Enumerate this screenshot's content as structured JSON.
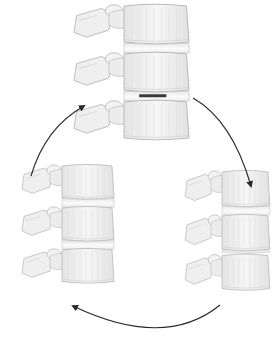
{
  "figure": {
    "title": "",
    "background": "#ffffff",
    "colors": {
      "bone_fill": "#f1f1f1",
      "bone_shade": "#d9d9d9",
      "bone_outline": "#b5b5b5",
      "disc_fill": "#fafafa",
      "disc_lesion": "#3a3a3a",
      "arrow": "#2a2a2a"
    },
    "stages": [
      {
        "id": "stage-top",
        "position": "top",
        "label": "",
        "disc_lesion": true
      },
      {
        "id": "stage-bottom-right",
        "position": "bottom-right",
        "label": "",
        "disc_lesion": false
      },
      {
        "id": "stage-bottom-left",
        "position": "bottom-left",
        "label": "",
        "disc_lesion": false
      }
    ],
    "arrows": [
      {
        "id": "arrow-top-to-right",
        "from": "top",
        "to": "bottom-right",
        "direction": "clockwise"
      },
      {
        "id": "arrow-right-to-left",
        "from": "bottom-right",
        "to": "bottom-left",
        "direction": "clockwise"
      },
      {
        "id": "arrow-left-to-top",
        "from": "bottom-left",
        "to": "top",
        "direction": "clockwise"
      }
    ]
  }
}
